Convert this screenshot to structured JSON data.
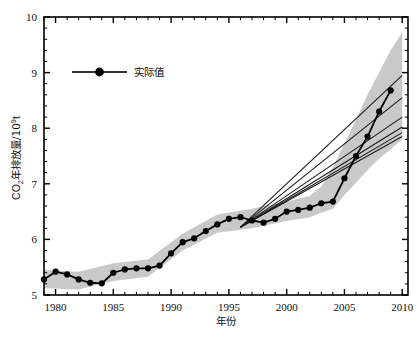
{
  "chart_data": {
    "type": "line",
    "title": "",
    "xlabel": "年份",
    "ylabel": "CO2年排放量/10^9t",
    "ylabel_parts": {
      "base": "CO",
      "sub": "2",
      "mid": "年排放量/10",
      "sup": "9",
      "tail": "t"
    },
    "xlim": [
      1979,
      2010.5
    ],
    "ylim": [
      5,
      10
    ],
    "xticks": [
      1980,
      1985,
      1990,
      1995,
      2000,
      2005,
      2010
    ],
    "xtick_labels": [
      "1980",
      "1985",
      "1990",
      "1995",
      "2000",
      "2005",
      "2010"
    ],
    "yticks": [
      5,
      6,
      7,
      8,
      9,
      10
    ],
    "ytick_labels": [
      "5",
      "6",
      "7",
      "8",
      "9",
      "10"
    ],
    "minor_xtick_interval": 1,
    "grid": false,
    "legend": {
      "position": "top-left-inside",
      "entries": [
        {
          "name": "实际值",
          "marker": "filled-circle",
          "line": "solid",
          "color": "#000000"
        }
      ]
    },
    "colors": {
      "series_line": "#000000",
      "marker": "#000000",
      "uncertainty_band": "#c9c9c9",
      "projection_line": "#1a1a1a",
      "axis": "#000000",
      "background": "#ffffff"
    },
    "series": [
      {
        "name": "实际值",
        "type": "line-marker",
        "x": [
          1979,
          1980,
          1981,
          1982,
          1983,
          1984,
          1985,
          1986,
          1987,
          1988,
          1989,
          1990,
          1991,
          1992,
          1993,
          1994,
          1995,
          1996,
          1997,
          1998,
          1999,
          2000,
          2001,
          2002,
          2003,
          2004,
          2005,
          2006,
          2007,
          2008,
          2009
        ],
        "values": [
          5.28,
          5.42,
          5.37,
          5.28,
          5.22,
          5.21,
          5.4,
          5.46,
          5.48,
          5.48,
          5.53,
          5.75,
          5.95,
          6.02,
          6.15,
          6.27,
          6.37,
          6.4,
          6.34,
          6.3,
          6.37,
          6.5,
          6.53,
          6.57,
          6.65,
          6.68,
          7.1,
          7.5,
          7.85,
          8.3,
          8.68
        ]
      }
    ],
    "uncertainty_band": {
      "name": "不确定区间",
      "x": [
        1979,
        1982,
        1985,
        1988,
        1991,
        1994,
        1997,
        2000,
        2002,
        2003,
        2004,
        2005,
        2006,
        2007,
        2008,
        2009,
        2010
      ],
      "lower": [
        5.12,
        5.1,
        5.25,
        5.33,
        5.8,
        6.12,
        6.2,
        6.33,
        6.4,
        6.48,
        6.55,
        6.8,
        7.02,
        7.25,
        7.45,
        7.62,
        7.8
      ],
      "upper": [
        5.45,
        5.42,
        5.57,
        5.64,
        6.1,
        6.45,
        6.55,
        6.68,
        6.78,
        6.95,
        7.3,
        7.72,
        8.15,
        8.6,
        9.0,
        9.4,
        9.72
      ]
    },
    "projection_lines": [
      {
        "name": "projection-1",
        "x": [
          1996,
          2010
        ],
        "y": [
          6.22,
          8.95
        ]
      },
      {
        "name": "projection-2",
        "x": [
          1996,
          2010
        ],
        "y": [
          6.22,
          8.55
        ]
      },
      {
        "name": "projection-3",
        "x": [
          1996,
          2010
        ],
        "y": [
          6.22,
          8.2
        ]
      },
      {
        "name": "projection-4",
        "x": [
          1996,
          2010
        ],
        "y": [
          6.22,
          8.02
        ]
      },
      {
        "name": "projection-5",
        "x": [
          1996,
          2010
        ],
        "y": [
          6.22,
          7.92
        ]
      },
      {
        "name": "projection-6",
        "x": [
          1996,
          2010
        ],
        "y": [
          6.22,
          7.85
        ]
      }
    ]
  }
}
